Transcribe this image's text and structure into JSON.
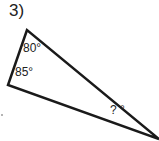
{
  "problem": {
    "number": "3)",
    "angles": {
      "top": "80°",
      "left": "85°",
      "right": "? °"
    }
  },
  "colors": {
    "stroke": "#1a1a1a",
    "text": "#222222"
  }
}
